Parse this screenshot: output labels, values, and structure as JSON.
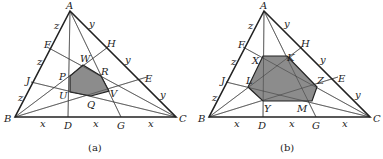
{
  "figures": [
    {
      "caption": "(a)",
      "vertices": {
        "A": [
          70,
          11
        ],
        "B": [
          15,
          117
        ],
        "C": [
          176,
          117
        ]
      },
      "side_points": {
        "D": [
          68,
          117
        ],
        "G": [
          121,
          117
        ],
        "F": [
          47,
          47
        ],
        "J": [
          31,
          82
        ],
        "H": [
          108,
          47
        ],
        "E": [
          147,
          77
        ]
      },
      "polygon_labels": [
        "W",
        "R",
        "V",
        "Q",
        "U",
        "P"
      ],
      "polygon": [
        [
          83,
          65
        ],
        [
          101,
          76
        ],
        [
          109,
          91
        ],
        [
          91,
          96
        ],
        [
          70,
          92
        ],
        [
          70,
          76
        ]
      ],
      "labels": [
        {
          "t": "A",
          "x": 66,
          "y": 9
        },
        {
          "t": "B",
          "x": 4,
          "y": 122
        },
        {
          "t": "C",
          "x": 179,
          "y": 122
        },
        {
          "t": "D",
          "x": 64,
          "y": 129
        },
        {
          "t": "G",
          "x": 117,
          "y": 129
        },
        {
          "t": "F",
          "x": 44,
          "y": 48
        },
        {
          "t": "J",
          "x": 26,
          "y": 84
        },
        {
          "t": "H",
          "x": 107,
          "y": 47
        },
        {
          "t": "E",
          "x": 145,
          "y": 82
        },
        {
          "t": "W",
          "x": 80,
          "y": 62
        },
        {
          "t": "R",
          "x": 101,
          "y": 75
        },
        {
          "t": "V",
          "x": 110,
          "y": 97
        },
        {
          "t": "Q",
          "x": 87,
          "y": 108
        },
        {
          "t": "U",
          "x": 59,
          "y": 99
        },
        {
          "t": "P",
          "x": 59,
          "y": 80
        },
        {
          "t": "z",
          "x": 54,
          "y": 29
        },
        {
          "t": "z",
          "x": 37,
          "y": 65
        },
        {
          "t": "z",
          "x": 18,
          "y": 101
        },
        {
          "t": "y",
          "x": 89,
          "y": 27
        },
        {
          "t": "y",
          "x": 125,
          "y": 63
        },
        {
          "t": "y",
          "x": 160,
          "y": 98
        },
        {
          "t": "x",
          "x": 40,
          "y": 127
        },
        {
          "t": "x",
          "x": 93,
          "y": 127
        },
        {
          "t": "x",
          "x": 148,
          "y": 127
        }
      ]
    },
    {
      "caption": "(b)",
      "vertices": {
        "A": [
          264,
          11
        ],
        "B": [
          209,
          117
        ],
        "C": [
          370,
          117
        ]
      },
      "side_points": {
        "D": [
          263,
          117
        ],
        "G": [
          316,
          117
        ],
        "F": [
          243,
          47
        ],
        "J": [
          226,
          82
        ],
        "H": [
          302,
          47
        ],
        "E": [
          338,
          77
        ]
      },
      "polygon_labels": [
        "X",
        "K",
        "Z",
        "M",
        "Y",
        "L"
      ],
      "polygon": [
        [
          263,
          56
        ],
        [
          287,
          56
        ],
        [
          317,
          87
        ],
        [
          312,
          101
        ],
        [
          263,
          101
        ],
        [
          248,
          87
        ]
      ],
      "labels": [
        {
          "t": "A",
          "x": 260,
          "y": 9
        },
        {
          "t": "B",
          "x": 198,
          "y": 122
        },
        {
          "t": "C",
          "x": 373,
          "y": 122
        },
        {
          "t": "D",
          "x": 258,
          "y": 129
        },
        {
          "t": "G",
          "x": 312,
          "y": 129
        },
        {
          "t": "F",
          "x": 238,
          "y": 48
        },
        {
          "t": "J",
          "x": 221,
          "y": 84
        },
        {
          "t": "H",
          "x": 301,
          "y": 47
        },
        {
          "t": "E",
          "x": 338,
          "y": 82
        },
        {
          "t": "X",
          "x": 252,
          "y": 64
        },
        {
          "t": "K",
          "x": 287,
          "y": 61
        },
        {
          "t": "Z",
          "x": 317,
          "y": 84
        },
        {
          "t": "M",
          "x": 297,
          "y": 112
        },
        {
          "t": "Y",
          "x": 264,
          "y": 112
        },
        {
          "t": "L",
          "x": 246,
          "y": 84
        },
        {
          "t": "z",
          "x": 248,
          "y": 29
        },
        {
          "t": "z",
          "x": 231,
          "y": 65
        },
        {
          "t": "z",
          "x": 212,
          "y": 101
        },
        {
          "t": "y",
          "x": 284,
          "y": 27
        },
        {
          "t": "y",
          "x": 320,
          "y": 63
        },
        {
          "t": "y",
          "x": 355,
          "y": 98
        },
        {
          "t": "x",
          "x": 234,
          "y": 127
        },
        {
          "t": "x",
          "x": 289,
          "y": 127
        },
        {
          "t": "x",
          "x": 342,
          "y": 127
        }
      ]
    }
  ],
  "captions_pos": [
    [
      88,
      151
    ],
    [
      280,
      151
    ]
  ]
}
